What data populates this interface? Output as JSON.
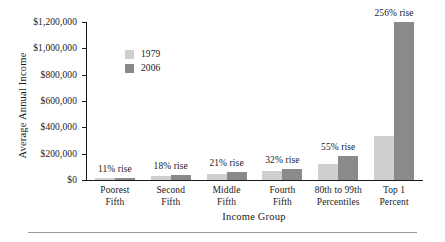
{
  "chart_data": {
    "type": "bar",
    "title": "",
    "xlabel": "Income Group",
    "ylabel": "Average Annual Income",
    "categories": [
      "Poorest Fifth",
      "Second Fifth",
      "Middle Fifth",
      "Fourth Fifth",
      "80th to 99th Percentiles",
      "Top 1 Percent"
    ],
    "category_lines": [
      [
        "Poorest",
        "Fifth"
      ],
      [
        "Second",
        "Fifth"
      ],
      [
        "Middle",
        "Fifth"
      ],
      [
        "Fourth",
        "Fifth"
      ],
      [
        "80th to 99th",
        "Percentiles"
      ],
      [
        "Top 1",
        "Percent"
      ]
    ],
    "series": [
      {
        "name": "1979",
        "color": "#cfcfcf",
        "values": [
          15300,
          31000,
          47200,
          65000,
          118000,
          337000
        ]
      },
      {
        "name": "2006",
        "color": "#8a8a8a",
        "values": [
          17000,
          36600,
          57100,
          85800,
          183000,
          1200000
        ]
      }
    ],
    "annotations": [
      "11% rise",
      "18% rise",
      "21% rise",
      "32% rise",
      "55% rise",
      "256% rise"
    ],
    "ylim": [
      0,
      1200000
    ],
    "yticks": [
      0,
      200000,
      400000,
      600000,
      800000,
      1000000,
      1200000
    ],
    "ytick_labels": [
      "$0",
      "$200,000",
      "$400,000",
      "$600,000",
      "$800,000",
      "$1,000,000",
      "$1,200,000"
    ],
    "grid": false,
    "legend": {
      "position": "upper-left-inside",
      "entries": [
        {
          "label": "1979",
          "color": "#cfcfcf"
        },
        {
          "label": "2006",
          "color": "#8a8a8a"
        }
      ]
    }
  }
}
